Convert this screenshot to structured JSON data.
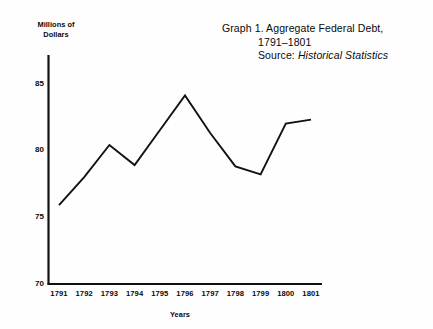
{
  "title": {
    "line1": "Graph 1.  Aggregate Federal Debt,",
    "line2": "1791–1801",
    "source_label": "Source: ",
    "source_value": "Historical Statistics"
  },
  "axes": {
    "y_title_line1": "Millions of",
    "y_title_line2": "Dollars",
    "x_title": "Years",
    "y_ticks": [
      "85",
      "80",
      "75",
      "70"
    ],
    "x_ticks": [
      "1791",
      "1792",
      "1793",
      "1794",
      "1795",
      "1796",
      "1797",
      "1798",
      "1799",
      "1800",
      "1801"
    ]
  },
  "colors": {
    "line": "#111111",
    "axis": "#111111",
    "background": "#fefefe",
    "text": "#0a0a0a"
  },
  "chart_data": {
    "type": "line",
    "subtitle": "Source: Historical Statistics",
    "xlabel": "Years",
    "ylabel": "Millions of Dollars",
    "x": [
      1791,
      1792,
      1793,
      1794,
      1795,
      1796,
      1797,
      1798,
      1799,
      1800,
      1801
    ],
    "categories": [
      "1791",
      "1792",
      "1793",
      "1794",
      "1795",
      "1796",
      "1797",
      "1798",
      "1799",
      "1800",
      "1801"
    ],
    "values": [
      75.9,
      78.0,
      80.4,
      78.9,
      81.5,
      84.1,
      81.3,
      78.8,
      78.2,
      82.0,
      82.3
    ],
    "series": [
      {
        "name": "Aggregate Federal Debt",
        "values": [
          75.9,
          78.0,
          80.4,
          78.9,
          81.5,
          84.1,
          81.3,
          78.8,
          78.2,
          82.0,
          82.3
        ]
      }
    ],
    "ylim": [
      70,
      87
    ],
    "yticks": [
      70,
      75,
      80,
      85
    ],
    "xlim": [
      1791,
      1801
    ],
    "grid": false,
    "legend": false
  }
}
